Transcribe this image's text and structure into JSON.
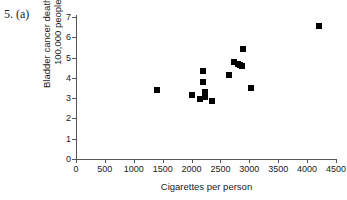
{
  "figure": {
    "label": "5. (a)"
  },
  "chart_data": {
    "type": "scatter",
    "title": "",
    "xlabel": "Cigarettes per person",
    "ylabel_line1": "Bladder cancer deaths per",
    "ylabel_line2": "100,000 people",
    "xlim": [
      0,
      4500
    ],
    "ylim": [
      0,
      7
    ],
    "xticks": [
      0,
      500,
      1000,
      1500,
      2000,
      2500,
      3000,
      3500,
      4000,
      4500
    ],
    "yticks": [
      0,
      1,
      2,
      3,
      4,
      5,
      6,
      7
    ],
    "xtick_labels": [
      "0",
      "500",
      "1000",
      "1500",
      "2000",
      "2500",
      "3000",
      "3500",
      "4000",
      "4500"
    ],
    "ytick_labels": [
      "0",
      "1",
      "2",
      "3",
      "4",
      "5",
      "6",
      "7"
    ],
    "grid": false,
    "legend": false,
    "marker": "square",
    "marker_color": "#000000",
    "points": [
      {
        "x": 1400,
        "y": 3.4
      },
      {
        "x": 2000,
        "y": 3.15
      },
      {
        "x": 2150,
        "y": 2.98
      },
      {
        "x": 2200,
        "y": 4.35
      },
      {
        "x": 2200,
        "y": 3.8
      },
      {
        "x": 2230,
        "y": 3.3
      },
      {
        "x": 2240,
        "y": 3.05
      },
      {
        "x": 2360,
        "y": 2.88
      },
      {
        "x": 2650,
        "y": 4.15
      },
      {
        "x": 2740,
        "y": 4.78
      },
      {
        "x": 2800,
        "y": 4.68
      },
      {
        "x": 2830,
        "y": 4.65
      },
      {
        "x": 2870,
        "y": 4.6
      },
      {
        "x": 2890,
        "y": 5.4
      },
      {
        "x": 3030,
        "y": 3.5
      },
      {
        "x": 4200,
        "y": 6.55
      }
    ]
  }
}
